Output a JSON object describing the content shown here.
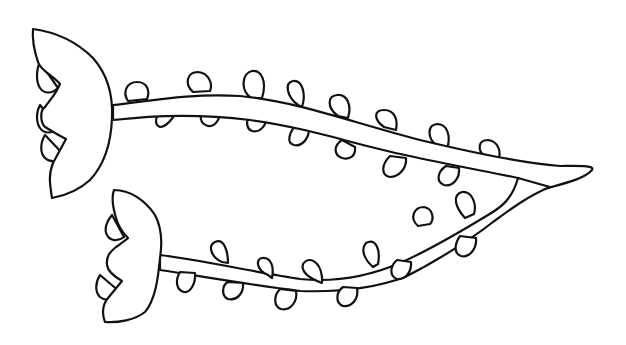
{
  "image": {
    "description": "Line drawing of two flowers on long curving vine stems with small looped leaves",
    "style": "black outline on white background",
    "colors": {
      "stroke": "#111111",
      "background": "#ffffff"
    },
    "elements": {
      "flowers": 2,
      "stems": 2,
      "top_stem_leaves": 15,
      "bottom_stem_leaves": 13
    }
  }
}
